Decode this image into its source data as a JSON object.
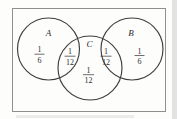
{
  "diagram": {
    "type": "venn",
    "sets": [
      {
        "label": "A"
      },
      {
        "label": "B"
      },
      {
        "label": "C"
      }
    ],
    "regions": [
      {
        "name": "A only",
        "numerator": "1",
        "denominator": "6"
      },
      {
        "name": "A and C",
        "numerator": "1",
        "denominator": "12"
      },
      {
        "name": "C and B",
        "numerator": "1",
        "denominator": "12"
      },
      {
        "name": "B only",
        "numerator": "1",
        "denominator": "6"
      },
      {
        "name": "C only",
        "numerator": "1",
        "denominator": "12"
      }
    ],
    "colors": {
      "circle_stroke": "#3e3e3e",
      "border_stroke": "#8f8f8f",
      "text": "#2e2e2e",
      "background": "#fdfdfc"
    }
  }
}
